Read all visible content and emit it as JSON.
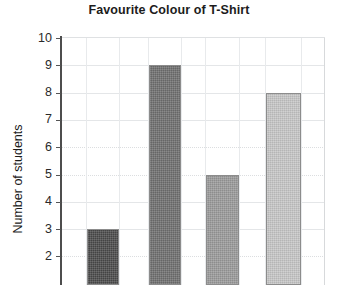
{
  "chart_data": {
    "type": "bar",
    "title": "Favourite Colour of T-Shirt",
    "xlabel": "",
    "ylabel": "Number of students",
    "categories": [
      "",
      "",
      "",
      ""
    ],
    "values": [
      3,
      9,
      5,
      8
    ],
    "ylim": [
      2,
      10
    ],
    "y_ticks": [
      10,
      9,
      8,
      7,
      6,
      5,
      4,
      3,
      2
    ],
    "y_tick_labels": [
      "10",
      "9",
      "8",
      "7",
      "6",
      "5",
      "4",
      "3",
      "2"
    ],
    "grid": true,
    "legend": "none",
    "note_cropped_bottom": "image cropped below value 2; no x-axis category labels visible",
    "bar_colors": [
      "#4a4a4a",
      "#6e6e6e",
      "#9a9a9a",
      "#c6c6c6"
    ],
    "bar_border_color": "#8c8c8c",
    "gridline_color": "#e4e6e8",
    "axis_color": "#4d4d4d",
    "text_color": "#1c1c1c",
    "background": "#ffffff",
    "bars": [
      {
        "value": 3,
        "color": "#4a4a4a",
        "left_px": 26,
        "width_px": 32
      },
      {
        "value": 9,
        "color": "#6e6e6e",
        "left_px": 88,
        "width_px": 32
      },
      {
        "value": 5,
        "color": "#9a9a9a",
        "left_px": 145,
        "width_px": 33
      },
      {
        "value": 8,
        "color": "#c6c6c6",
        "left_px": 205,
        "width_px": 35
      }
    ],
    "vertical_gridlines_px": [
      25,
      58,
      87,
      120,
      144,
      178,
      204,
      240,
      264
    ]
  }
}
